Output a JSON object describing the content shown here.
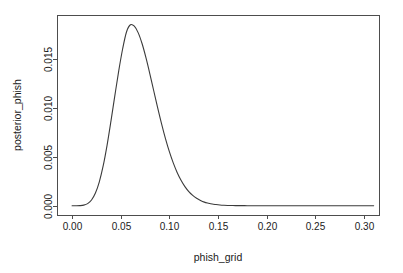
{
  "figure": {
    "background": "#ffffff",
    "foreground": "#1a1a1a",
    "box_color": "#4d4d4d",
    "curve_color": "#3b3b3b"
  },
  "chart_data": {
    "type": "line",
    "title": "",
    "subtitle": "",
    "xlabel": "phish_grid",
    "ylabel": "posterior_phish",
    "xlim": [
      -0.0155,
      0.3155
    ],
    "ylim": [
      -0.00095,
      0.01955
    ],
    "xticks": [
      0.0,
      0.05,
      0.1,
      0.15,
      0.2,
      0.25,
      0.3
    ],
    "xticklabels": [
      "0.00",
      "0.05",
      "0.10",
      "0.15",
      "0.20",
      "0.25",
      "0.30"
    ],
    "yticks": [
      0.0,
      0.005,
      0.01,
      0.015
    ],
    "yticklabels": [
      "0.000",
      "0.005",
      "0.010",
      "0.015"
    ],
    "grid": false,
    "legend": null,
    "box": "full",
    "annotations": [],
    "series": [
      {
        "name": "posterior_phish",
        "color": "#3b3b3b",
        "linewidth": 1.1,
        "peak_x": 0.0505,
        "peak_y": 0.01855,
        "x": [
          0.0,
          0.004,
          0.008,
          0.012,
          0.016,
          0.02,
          0.024,
          0.028,
          0.032,
          0.036,
          0.04,
          0.044,
          0.048,
          0.052,
          0.056,
          0.06,
          0.064,
          0.068,
          0.072,
          0.076,
          0.08,
          0.084,
          0.088,
          0.092,
          0.096,
          0.1,
          0.104,
          0.108,
          0.112,
          0.116,
          0.12,
          0.124,
          0.128,
          0.132,
          0.136,
          0.14,
          0.144,
          0.148,
          0.152,
          0.156,
          0.16,
          0.164,
          0.168,
          0.172,
          0.176,
          0.18,
          0.19,
          0.2,
          0.21,
          0.22,
          0.23,
          0.24,
          0.25,
          0.26,
          0.27,
          0.28,
          0.29,
          0.3,
          0.31
        ],
        "y": [
          0.0,
          0.0,
          1e-05,
          6e-05,
          0.00022,
          0.00059,
          0.0013,
          0.00245,
          0.0041,
          0.00622,
          0.00869,
          0.01131,
          0.01385,
          0.01609,
          0.01783,
          0.01855,
          0.0184,
          0.01772,
          0.0166,
          0.01515,
          0.0135,
          0.01176,
          0.01003,
          0.00839,
          0.00688,
          0.00554,
          0.00439,
          0.00341,
          0.00261,
          0.00196,
          0.00145,
          0.00106,
          0.00076,
          0.00054,
          0.00037,
          0.00026,
          0.00017,
          0.00012,
          8e-05,
          5e-05,
          3e-05,
          2e-05,
          1e-05,
          1e-05,
          1e-05,
          0.0,
          0.0,
          0.0,
          0.0,
          0.0,
          0.0,
          0.0,
          0.0,
          0.0,
          0.0,
          0.0,
          0.0,
          0.0,
          0.0
        ]
      }
    ]
  },
  "layout": {
    "plot_left": 57,
    "plot_right": 379,
    "plot_top": 15,
    "plot_bottom": 215,
    "tick_len": 4,
    "x_axis_y": 215,
    "y_axis_x": 57,
    "xlabel_pos": {
      "x": 218,
      "y": 261
    },
    "ylabel_pos": {
      "x": 21,
      "y": 115
    }
  }
}
